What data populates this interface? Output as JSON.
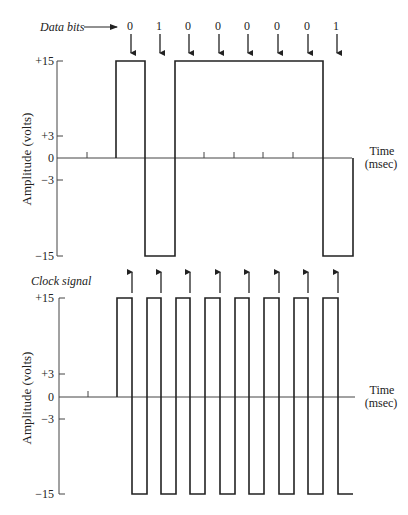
{
  "top_chart": {
    "label": "Data bits",
    "bits": [
      "0",
      "1",
      "0",
      "0",
      "0",
      "0",
      "0",
      "1"
    ],
    "y_ticks": [
      "+15",
      "+3",
      "0",
      "−3",
      "−15"
    ],
    "y_label": "Amplitude (volts)",
    "x_label_1": "Time",
    "x_label_2": "(msec)"
  },
  "bottom_chart": {
    "label": "Clock signal",
    "y_ticks": [
      "+15",
      "+3",
      "0",
      "−3",
      "−15"
    ],
    "y_label": "Amplitude (volts)",
    "x_label_1": "Time",
    "x_label_2": "(msec)"
  },
  "colors": {
    "line": "#222222",
    "axis": "#444444"
  }
}
